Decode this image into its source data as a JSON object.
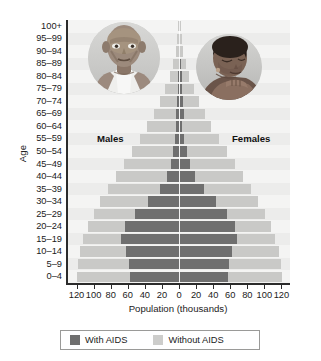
{
  "chart_data": {
    "type": "bar",
    "subtype": "population-pyramid",
    "title": "",
    "xlabel": "Population (thousands)",
    "ylabel": "Age",
    "grid": false,
    "legend_position": "bottom",
    "xlim": [
      -130,
      130
    ],
    "xticks": [
      120,
      100,
      80,
      60,
      40,
      20,
      0,
      20,
      40,
      60,
      80,
      100,
      120
    ],
    "xtick_values": [
      -120,
      -100,
      -80,
      -60,
      -40,
      -20,
      0,
      20,
      40,
      60,
      80,
      100,
      120
    ],
    "categories": [
      "100+",
      "95–99",
      "90–94",
      "85–89",
      "80–84",
      "75–79",
      "70–74",
      "65–69",
      "60–64",
      "55–59",
      "50–54",
      "45–49",
      "40–44",
      "35–39",
      "30–34",
      "25–29",
      "20–24",
      "15–19",
      "10–14",
      "5–9",
      "0–4"
    ],
    "series": [
      {
        "name": "Males — With AIDS",
        "side": "left",
        "color": "#6f6f6f",
        "values": [
          0,
          0,
          0,
          0.5,
          1,
          1.5,
          2,
          3,
          4,
          5,
          7,
          9,
          14,
          22,
          36,
          52,
          63,
          68,
          62,
          58,
          57
        ]
      },
      {
        "name": "Males — Without AIDS",
        "side": "left",
        "color": "#c9c9c7",
        "values": [
          1,
          2,
          4,
          7,
          11,
          16,
          22,
          29,
          37,
          46,
          55,
          64,
          74,
          83,
          92,
          100,
          107,
          112,
          116,
          118,
          120
        ]
      },
      {
        "name": "Females — With AIDS",
        "side": "right",
        "color": "#6f6f6f",
        "values": [
          0.5,
          1,
          1.5,
          2,
          3,
          4,
          5,
          6,
          4,
          6,
          9,
          13,
          19,
          29,
          43,
          56,
          65,
          68,
          62,
          58,
          57
        ]
      },
      {
        "name": "Females — Without AIDS",
        "side": "right",
        "color": "#c9c9c7",
        "values": [
          2,
          3,
          5,
          8,
          12,
          17,
          23,
          30,
          38,
          47,
          56,
          65,
          75,
          84,
          93,
          101,
          108,
          113,
          117,
          119,
          121
        ]
      }
    ],
    "annotations": [
      {
        "text": "Males",
        "x": -82,
        "category": "55–59"
      },
      {
        "text": "Females",
        "x": 80,
        "category": "55–59"
      }
    ],
    "legend": [
      {
        "label": "With AIDS",
        "color": "#6f6f6f"
      },
      {
        "label": "Without AIDS",
        "color": "#cdcdcb"
      }
    ]
  },
  "labels": {
    "side_males": "Males",
    "side_females": "Females",
    "axis_y_title": "Age",
    "axis_x_title": "Population (thousands)"
  },
  "photos": [
    {
      "name": "photo-male-patient",
      "alt": "Emaciated man in white tank top"
    },
    {
      "name": "photo-female-patient",
      "alt": "Woman with head lowered, arms crossed"
    }
  ],
  "colors": {
    "with_aids": "#6f6f6f",
    "without_aids": "#c9c9c7",
    "plot_background": "#f2f2f0",
    "axis": "#2b2b2b"
  }
}
